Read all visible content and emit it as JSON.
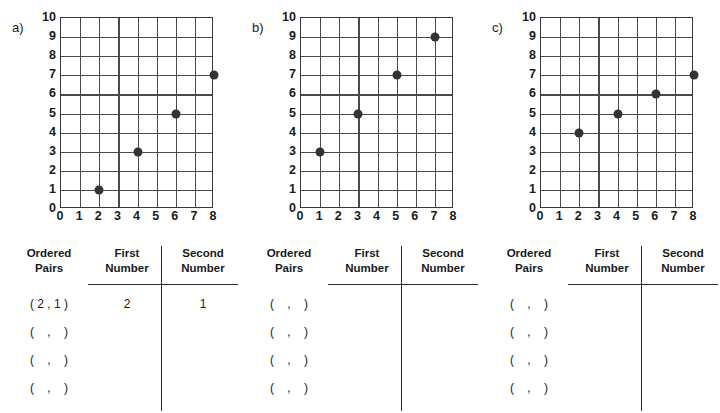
{
  "chart_data": [
    {
      "type": "scatter",
      "title": "a)",
      "xlabel": "",
      "ylabel": "",
      "x": [
        2,
        4,
        6,
        8
      ],
      "y": [
        1,
        3,
        5,
        7
      ],
      "points": [
        [
          2,
          1
        ],
        [
          4,
          3
        ],
        [
          6,
          5
        ],
        [
          8,
          7
        ]
      ],
      "xlim": [
        0,
        8
      ],
      "ylim": [
        0,
        10
      ],
      "xticks": [
        "0",
        "1",
        "2",
        "3",
        "4",
        "5",
        "6",
        "7",
        "8"
      ],
      "yticks": [
        "0",
        "1",
        "2",
        "3",
        "4",
        "5",
        "6",
        "7",
        "8",
        "9",
        "10"
      ],
      "grid": true,
      "legend": "none"
    },
    {
      "type": "scatter",
      "title": "b)",
      "xlabel": "",
      "ylabel": "",
      "x": [
        1,
        3,
        5,
        7
      ],
      "y": [
        3,
        5,
        7,
        9
      ],
      "points": [
        [
          1,
          3
        ],
        [
          3,
          5
        ],
        [
          5,
          7
        ],
        [
          7,
          9
        ]
      ],
      "xlim": [
        0,
        8
      ],
      "ylim": [
        0,
        10
      ],
      "xticks": [
        "0",
        "1",
        "2",
        "3",
        "4",
        "5",
        "6",
        "7",
        "8"
      ],
      "yticks": [
        "0",
        "1",
        "2",
        "3",
        "4",
        "5",
        "6",
        "7",
        "8",
        "9",
        "10"
      ],
      "grid": true,
      "legend": "none"
    },
    {
      "type": "scatter",
      "title": "c)",
      "xlabel": "",
      "ylabel": "",
      "x": [
        2,
        4,
        6,
        8
      ],
      "y": [
        4,
        5,
        6,
        7
      ],
      "points": [
        [
          2,
          4
        ],
        [
          4,
          5
        ],
        [
          6,
          6
        ],
        [
          8,
          7
        ]
      ],
      "xlim": [
        0,
        8
      ],
      "ylim": [
        0,
        10
      ],
      "xticks": [
        "0",
        "1",
        "2",
        "3",
        "4",
        "5",
        "6",
        "7",
        "8"
      ],
      "yticks": [
        "0",
        "1",
        "2",
        "3",
        "4",
        "5",
        "6",
        "7",
        "8",
        "9",
        "10"
      ],
      "grid": true,
      "legend": "none"
    }
  ],
  "colors": {
    "point": "#333333",
    "grid_line": "#4a4a4a",
    "grid_border": "#3a3a3a",
    "rule": "#2b2b2b",
    "text": "#1a1a1a",
    "background": "#ffffff"
  },
  "panels": [
    {
      "letter": "a)",
      "yticks": [
        "10",
        "9",
        "8",
        "7",
        "6",
        "5",
        "4",
        "3",
        "2",
        "1",
        "0"
      ],
      "xticks": [
        "0",
        "1",
        "2",
        "3",
        "4",
        "5",
        "6",
        "7",
        "8"
      ],
      "table": {
        "headers": {
          "ordered_pairs": "Ordered\nPairs",
          "first_number": "First\nNumber",
          "second_number": "Second\nNumber"
        },
        "rows": [
          {
            "pair": "( 2 , 1 )",
            "first": "2",
            "second": "1"
          },
          {
            "pair": "(    ,    )",
            "first": "",
            "second": ""
          },
          {
            "pair": "(    ,    )",
            "first": "",
            "second": ""
          },
          {
            "pair": "(    ,    )",
            "first": "",
            "second": ""
          }
        ]
      }
    },
    {
      "letter": "b)",
      "yticks": [
        "10",
        "9",
        "8",
        "7",
        "6",
        "5",
        "4",
        "3",
        "2",
        "1",
        "0"
      ],
      "xticks": [
        "0",
        "1",
        "2",
        "3",
        "4",
        "5",
        "6",
        "7",
        "8"
      ],
      "table": {
        "headers": {
          "ordered_pairs": "Ordered\nPairs",
          "first_number": "First\nNumber",
          "second_number": "Second\nNumber"
        },
        "rows": [
          {
            "pair": "(    ,    )",
            "first": "",
            "second": ""
          },
          {
            "pair": "(    ,    )",
            "first": "",
            "second": ""
          },
          {
            "pair": "(    ,    )",
            "first": "",
            "second": ""
          },
          {
            "pair": "(    ,    )",
            "first": "",
            "second": ""
          }
        ]
      }
    },
    {
      "letter": "c)",
      "yticks": [
        "10",
        "9",
        "8",
        "7",
        "6",
        "5",
        "4",
        "3",
        "2",
        "1",
        "0"
      ],
      "xticks": [
        "0",
        "1",
        "2",
        "3",
        "4",
        "5",
        "6",
        "7",
        "8"
      ],
      "table": {
        "headers": {
          "ordered_pairs": "Ordered\nPairs",
          "first_number": "First\nNumber",
          "second_number": "Second\nNumber"
        },
        "rows": [
          {
            "pair": "(    ,    )",
            "first": "",
            "second": ""
          },
          {
            "pair": "(    ,    )",
            "first": "",
            "second": ""
          },
          {
            "pair": "(    ,    )",
            "first": "",
            "second": ""
          },
          {
            "pair": "(    ,    )",
            "first": "",
            "second": ""
          }
        ]
      }
    }
  ]
}
